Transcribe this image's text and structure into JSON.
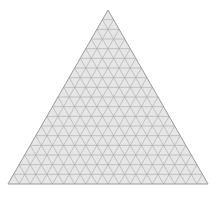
{
  "diagram": {
    "type": "ternary-grid",
    "divisions": 18,
    "vertices": {
      "top": [
        108,
        10
      ],
      "left": [
        8,
        184
      ],
      "right": [
        208,
        184
      ]
    },
    "colors": {
      "background": "#ffffff",
      "fill": "#e6e6e6",
      "grid": "#a8a8a8",
      "outline": "#9a9a9a"
    }
  }
}
